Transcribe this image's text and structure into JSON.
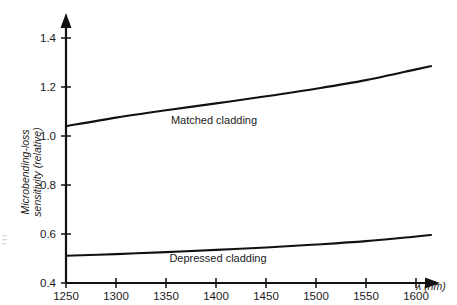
{
  "chart_data": {
    "type": "line",
    "title": "",
    "subtitle": "",
    "xlabel": "λ (nm)",
    "ylabel": "Microbending-loss sensitivity (relative)",
    "ylabel_line1": "Microbending-loss",
    "ylabel_line2": "sensitivity (relative)",
    "xlim": [
      1250,
      1620
    ],
    "ylim": [
      0.4,
      1.45
    ],
    "xticks": [
      1250,
      1300,
      1350,
      1400,
      1450,
      1500,
      1550,
      1600
    ],
    "xtick_labels": [
      "1250",
      "1300",
      "1350",
      "1400",
      "1450",
      "1500",
      "1550",
      "1600"
    ],
    "yticks": [
      0.4,
      0.6,
      0.8,
      1.0,
      1.2,
      1.4
    ],
    "ytick_labels": [
      "0.4",
      "0.6",
      "0.8",
      "1.0",
      "1.2",
      "1.4"
    ],
    "grid": false,
    "legend_position": "inline-annotation",
    "x": [
      1250,
      1300,
      1350,
      1400,
      1450,
      1500,
      1550,
      1600,
      1615
    ],
    "series": [
      {
        "name": "Matched cladding",
        "label": "Matched cladding",
        "color": "#111111",
        "values": [
          1.04,
          1.075,
          1.105,
          1.133,
          1.162,
          1.193,
          1.228,
          1.272,
          1.285
        ]
      },
      {
        "name": "Depressed cladding",
        "label": "Depressed cladding",
        "color": "#111111",
        "values": [
          0.511,
          0.518,
          0.526,
          0.535,
          0.545,
          0.557,
          0.571,
          0.59,
          0.596
        ]
      }
    ],
    "annotations": [
      {
        "text": "Matched cladding",
        "x": 1400,
        "y": 1.095
      },
      {
        "text": "Depressed cladding",
        "x": 1405,
        "y": 0.472
      }
    ]
  },
  "axes": {
    "x_arrow": "arrow-right-icon",
    "y_arrow": "arrow-up-icon"
  }
}
